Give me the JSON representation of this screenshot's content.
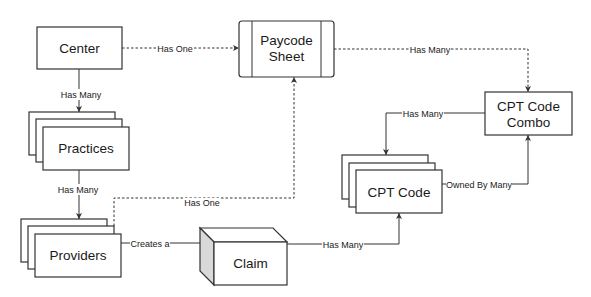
{
  "diagram": {
    "nodes": {
      "center": {
        "label": "Center",
        "shape": "rectangle"
      },
      "paycode_sheet": {
        "label_line1": "Paycode",
        "label_line2": "Sheet",
        "shape": "process"
      },
      "practices": {
        "label": "Practices",
        "shape": "stacked-rectangles"
      },
      "providers": {
        "label": "Providers",
        "shape": "stacked-rectangles"
      },
      "claim": {
        "label": "Claim",
        "shape": "cube"
      },
      "cpt_code_combo": {
        "label_line1": "CPT Code",
        "label_line2": "Combo",
        "shape": "rectangle"
      },
      "cpt_code": {
        "label": "CPT Code",
        "shape": "stacked-rectangles"
      }
    },
    "edges": {
      "center_paycode": {
        "from": "Center",
        "to": "Paycode Sheet",
        "label": "Has One",
        "style": "dashed"
      },
      "center_practices": {
        "from": "Center",
        "to": "Practices",
        "label": "Has Many",
        "style": "solid"
      },
      "practices_providers": {
        "from": "Practices",
        "to": "Providers",
        "label": "Has Many",
        "style": "solid"
      },
      "providers_paycode": {
        "from": "Providers",
        "to": "Paycode Sheet",
        "label": "Has One",
        "style": "dashed"
      },
      "providers_claim": {
        "from": "Providers",
        "to": "Claim",
        "label": "Creates a",
        "style": "solid"
      },
      "paycode_combo": {
        "from": "Paycode Sheet",
        "to": "CPT Code Combo",
        "label": "Has Many",
        "style": "dashed"
      },
      "combo_cptcode": {
        "from": "CPT Code Combo",
        "to": "CPT Code",
        "label": "Has Many",
        "style": "solid"
      },
      "cptcode_combo": {
        "from": "CPT Code",
        "to": "CPT Code Combo",
        "label": "Owned By Many",
        "style": "solid"
      },
      "claim_cptcode": {
        "from": "Claim",
        "to": "CPT Code",
        "label": "Has Many",
        "style": "solid"
      }
    },
    "colors": {
      "stroke": "#333333",
      "fill": "#ffffff",
      "cube_side": "#d9d9d9",
      "text": "#1a1a1a"
    }
  }
}
